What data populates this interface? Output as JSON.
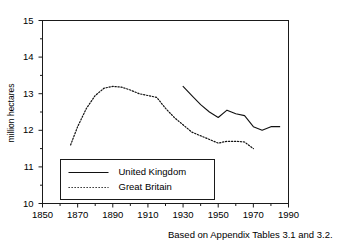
{
  "chart_data": {
    "type": "line",
    "title": "",
    "subtitle": "",
    "xlabel": "",
    "ylabel": "million hectares",
    "xlim": [
      1850,
      1990
    ],
    "ylim": [
      10,
      15
    ],
    "grid": false,
    "legend_position": "lower-left-inside",
    "annotations": [
      "Based on Appendix Tables 3.1 and 3.2."
    ],
    "x_ticks_major": [
      1850,
      1870,
      1890,
      1910,
      1930,
      1950,
      1970,
      1990
    ],
    "x_ticks_major_labels": [
      "1850",
      "1870",
      "1890",
      "1910",
      "1930",
      "1950",
      "1970",
      "1990"
    ],
    "x_ticks_minor": [
      1860,
      1880,
      1900,
      1920,
      1940,
      1960,
      1980
    ],
    "y_ticks_major": [
      10,
      11,
      12,
      13,
      14,
      15
    ],
    "y_ticks_major_labels": [
      "10",
      "11",
      "12",
      "13",
      "14",
      "15"
    ],
    "y_ticks_minor": [
      10.5,
      11.5,
      12.5,
      13.5,
      14.5
    ],
    "series": [
      {
        "name": "United Kingdom",
        "style": "solid",
        "color": "#111111",
        "x": [
          1930,
          1935,
          1940,
          1945,
          1950,
          1955,
          1960,
          1965,
          1970,
          1975,
          1980,
          1985
        ],
        "values": [
          13.2,
          12.95,
          12.7,
          12.5,
          12.35,
          12.55,
          12.45,
          12.4,
          12.1,
          12.0,
          12.1,
          12.1
        ]
      },
      {
        "name": "Great Britain",
        "style": "dotted",
        "color": "#111111",
        "x": [
          1866,
          1870,
          1875,
          1880,
          1885,
          1890,
          1895,
          1900,
          1905,
          1910,
          1915,
          1920,
          1925,
          1930,
          1935,
          1940,
          1945,
          1950,
          1955,
          1960,
          1965,
          1970
        ],
        "values": [
          11.6,
          12.1,
          12.6,
          12.95,
          13.15,
          13.2,
          13.18,
          13.1,
          13.0,
          12.95,
          12.9,
          12.6,
          12.35,
          12.15,
          11.95,
          11.85,
          11.75,
          11.65,
          11.7,
          11.7,
          11.68,
          11.5
        ]
      }
    ]
  },
  "chart": {
    "y_axis_label": "million hectares",
    "caption": "Based on Appendix Tables 3.1 and 3.2."
  },
  "legend": {
    "entries": [
      {
        "label": "United Kingdom",
        "style": "solid"
      },
      {
        "label": "Great Britain",
        "style": "dotted"
      }
    ]
  }
}
